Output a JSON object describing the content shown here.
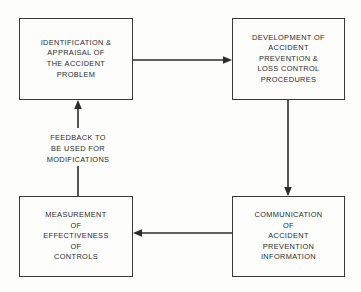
{
  "diagram": {
    "background_color": "#fdfdfb",
    "line_color": "#2b2b2b",
    "nodes": [
      {
        "id": "identification",
        "name": "Identification & Appraisal of the Accident Problem",
        "lines": [
          "IDENTIFICATION &",
          "APPRAISAL OF",
          "THE ACCIDENT",
          "PROBLEM"
        ]
      },
      {
        "id": "development",
        "name": "Development of Accident Prevention & Loss Control Procedures",
        "lines": [
          "DEVELOPMENT OF",
          "ACCIDENT",
          "PREVENTION &",
          "LOSS CONTROL",
          "PROCEDURES"
        ]
      },
      {
        "id": "communication",
        "name": "Communication of Accident Prevention Information",
        "lines": [
          "COMMUNICATION",
          "OF",
          "ACCIDENT",
          "PREVENTION",
          "INFORMATION"
        ]
      },
      {
        "id": "measurement",
        "name": "Measurement of Effectiveness of Controls",
        "lines": [
          "MEASUREMENT",
          "OF",
          "EFFECTIVENESS",
          "OF",
          "CONTROLS"
        ]
      }
    ],
    "edge_label": {
      "id": "feedback",
      "lines": [
        "FEEDBACK TO",
        "BE USED FOR",
        "MODIFICATIONS"
      ]
    },
    "edges": [
      {
        "id": "identification-to-development",
        "from": "identification",
        "to": "development",
        "direction": "right"
      },
      {
        "id": "development-to-communication",
        "from": "development",
        "to": "communication",
        "direction": "down"
      },
      {
        "id": "communication-to-measurement",
        "from": "communication",
        "to": "measurement",
        "direction": "left"
      },
      {
        "id": "measurement-to-identification",
        "from": "measurement",
        "to": "identification",
        "direction": "up",
        "label": "feedback"
      }
    ]
  }
}
